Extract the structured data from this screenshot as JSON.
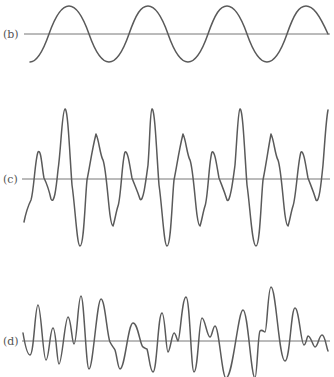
{
  "panels": [
    {
      "label": "(b)",
      "axis_y": 34,
      "axis_x_start": 24,
      "axis_x_end": 330,
      "description": "pure sine wave",
      "color": "#5a5a5a"
    },
    {
      "label": "(c)",
      "axis_y": 179,
      "axis_x_start": 22,
      "axis_x_end": 330,
      "description": "periodic complex waveform",
      "color": "#5a5a5a"
    },
    {
      "label": "(d)",
      "axis_y": 341,
      "axis_x_start": 22,
      "axis_x_end": 330,
      "description": "aperiodic/noise-like waveform",
      "color": "#5a5a5a"
    }
  ]
}
